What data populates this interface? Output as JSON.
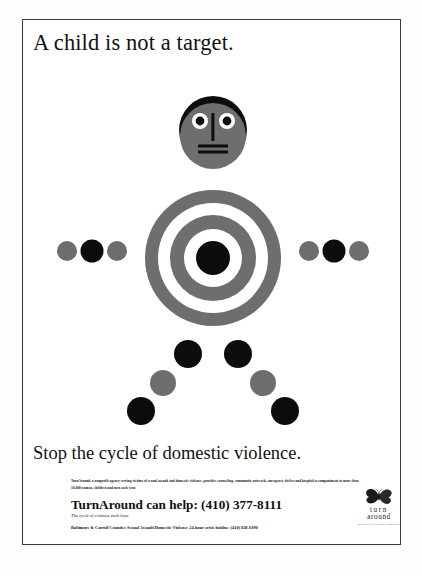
{
  "poster": {
    "headline": "A child is not a target.",
    "subhead": "Stop the cycle of domestic violence.",
    "bodycopy": "TurnAround, a nonprofit agency serving victims of sexual assault and domestic violence, provides counseling, community outreach, emergency shelter and hospital accompaniment to more than 10,000 women, children and men each year.",
    "helpline": "TurnAround can help: (410) 377-8111",
    "tagline": "The cycle of violence ends here.",
    "hotline": "Baltimore & Carroll Counties Sexual Assault/Domestic Violence 24-hour crisis hotline: (410) 828-6390"
  },
  "logo": {
    "icon": "butterfly-icon",
    "word1": "turn",
    "word2": "around",
    "tagline": "the cycle of violence ends here"
  },
  "figure": {
    "colors": {
      "gray": "#6e6e6e",
      "black": "#0d0d0d",
      "white": "#ffffff"
    },
    "head": {
      "cx": 190,
      "cy": 110,
      "r": 34,
      "hair_color": "#0d0d0d",
      "face_color": "#6e6e6e",
      "eyes": [
        {
          "cx": 177,
          "cy": 101,
          "r_white": 8,
          "r_pupil": 4.4
        },
        {
          "cx": 204,
          "cy": 101,
          "r_white": 8,
          "r_pupil": 4.4
        }
      ],
      "nose": {
        "x": 190,
        "y1": 95,
        "y2": 120
      },
      "mouth": [
        {
          "y": 126,
          "x1": 175,
          "x2": 205
        },
        {
          "y": 131,
          "x1": 175,
          "x2": 205
        }
      ]
    },
    "target": {
      "cx": 190,
      "cy": 238,
      "rings": [
        {
          "r": 68,
          "fill": "#6e6e6e"
        },
        {
          "r": 55,
          "fill": "#ffffff"
        },
        {
          "r": 43,
          "fill": "#6e6e6e"
        },
        {
          "r": 29,
          "fill": "#ffffff"
        },
        {
          "r": 17,
          "fill": "#0d0d0d"
        }
      ]
    },
    "arms": {
      "left": [
        {
          "cx": 44,
          "cy": 231,
          "r": 10,
          "fill": "#6e6e6e"
        },
        {
          "cx": 69,
          "cy": 231,
          "r": 11.5,
          "fill": "#0d0d0d"
        },
        {
          "cx": 94,
          "cy": 231,
          "r": 10,
          "fill": "#6e6e6e"
        }
      ],
      "right": [
        {
          "cx": 286,
          "cy": 231,
          "r": 10,
          "fill": "#6e6e6e"
        },
        {
          "cx": 311,
          "cy": 231,
          "r": 11.5,
          "fill": "#0d0d0d"
        },
        {
          "cx": 336,
          "cy": 231,
          "r": 10,
          "fill": "#6e6e6e"
        }
      ]
    },
    "legs": {
      "left": [
        {
          "cx": 165,
          "cy": 334,
          "r": 14,
          "fill": "#0d0d0d"
        },
        {
          "cx": 140,
          "cy": 363,
          "r": 13,
          "fill": "#6e6e6e"
        },
        {
          "cx": 118,
          "cy": 391,
          "r": 14,
          "fill": "#0d0d0d"
        }
      ],
      "right": [
        {
          "cx": 215,
          "cy": 334,
          "r": 14,
          "fill": "#0d0d0d"
        },
        {
          "cx": 240,
          "cy": 363,
          "r": 13,
          "fill": "#6e6e6e"
        },
        {
          "cx": 262,
          "cy": 391,
          "r": 14,
          "fill": "#0d0d0d"
        }
      ]
    }
  }
}
